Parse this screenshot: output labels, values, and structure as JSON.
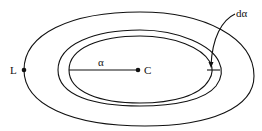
{
  "diagram": {
    "type": "nested-ellipses",
    "labels": {
      "outer_point": "L",
      "center_point": "C",
      "radius": "α",
      "increment": "dα"
    },
    "colors": {
      "line": "#111111",
      "background": "#ffffff"
    }
  }
}
